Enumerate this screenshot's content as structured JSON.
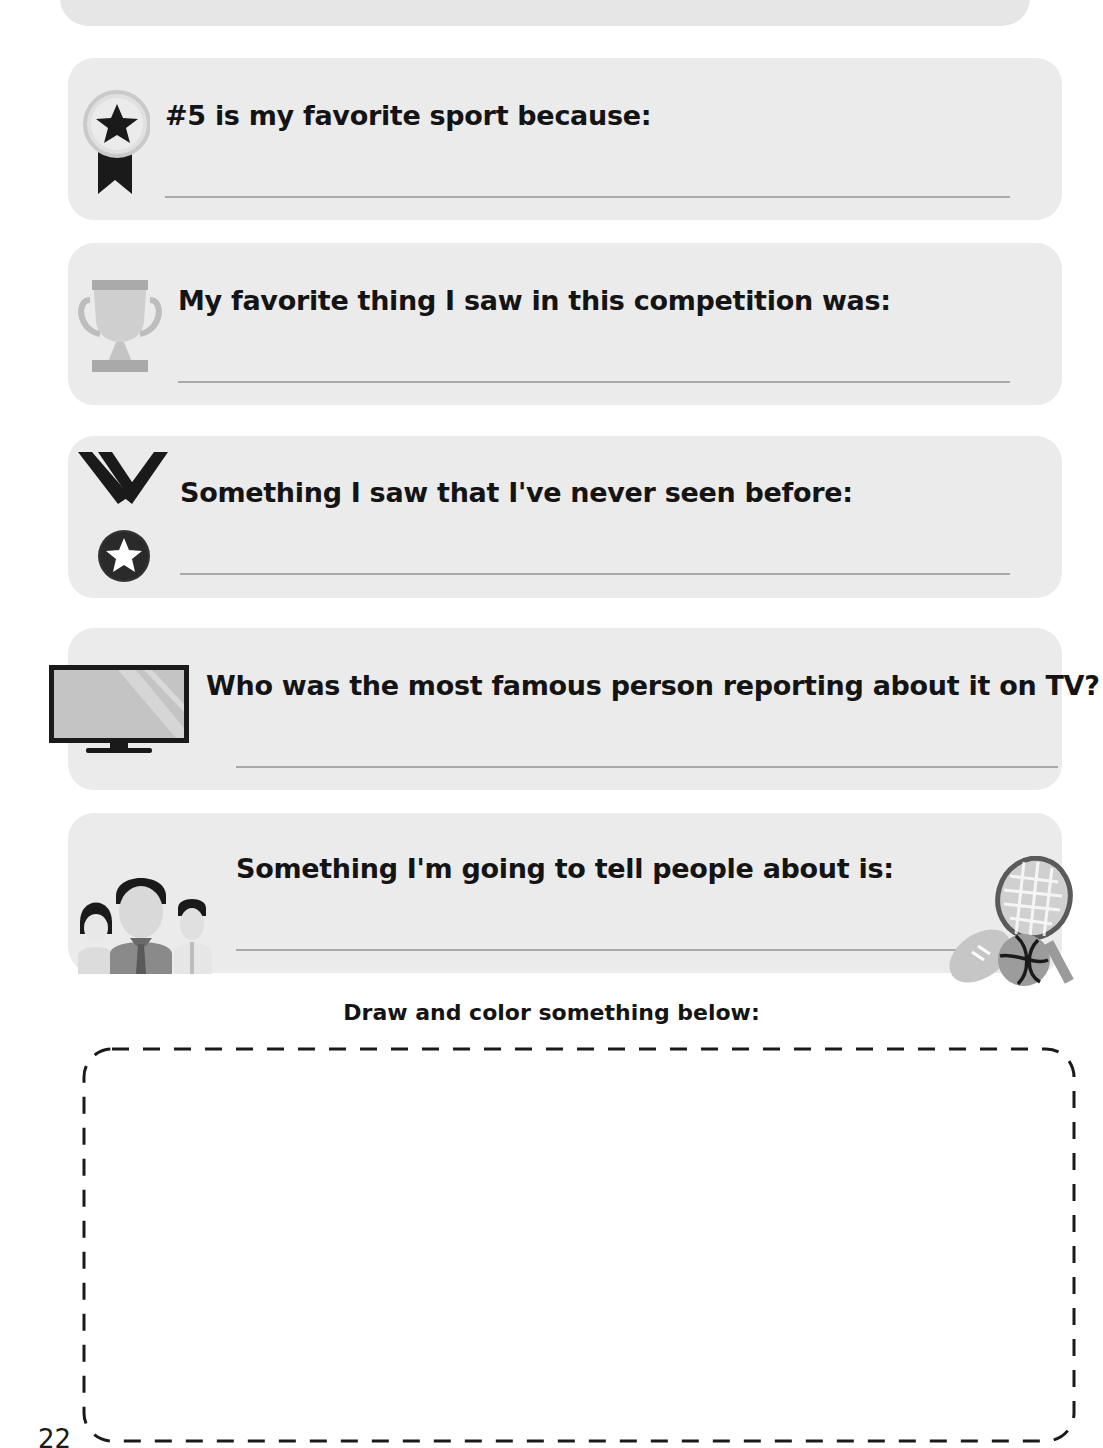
{
  "prompts": [
    {
      "icon": "medal-ribbon-icon",
      "text": "#5 is my favorite sport because:"
    },
    {
      "icon": "trophy-icon",
      "text": "My favorite thing I saw in this competition was:"
    },
    {
      "icon": "medal-icon",
      "text": "Something I saw that I've never seen before:"
    },
    {
      "icon": "tv-icon",
      "text": "Who was the most famous person reporting about it on TV?"
    },
    {
      "icon": "people-icon",
      "text": "Something I'm going to tell people about is:"
    }
  ],
  "decorations": {
    "sports_icon": "sports-equipment-icon"
  },
  "drawing": {
    "label": "Draw and color something below:"
  },
  "footer": {
    "page_number": "22"
  },
  "colors": {
    "card_bg": "#ebebeb",
    "line": "#a9a9a9",
    "text": "#141414"
  }
}
